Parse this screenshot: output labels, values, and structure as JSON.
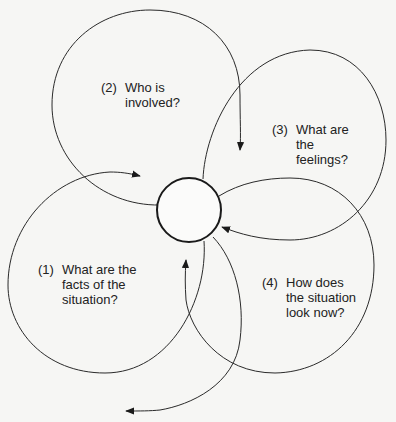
{
  "diagram": {
    "type": "cyclic-loop-diagram",
    "center": {
      "shape": "circle",
      "label": ""
    },
    "loops": [
      {
        "number": "(1)",
        "text": "What are the\nfacts of the\nsituation?"
      },
      {
        "number": "(2)",
        "text": "Who is\ninvolved?"
      },
      {
        "number": "(3)",
        "text": "What are\nthe\nfeelings?"
      },
      {
        "number": "(4)",
        "text": "How does\nthe situation\nlook now?"
      }
    ],
    "colors": {
      "line": "#2a2a2a",
      "background": "#f6f6f4",
      "text": "#222222"
    }
  }
}
